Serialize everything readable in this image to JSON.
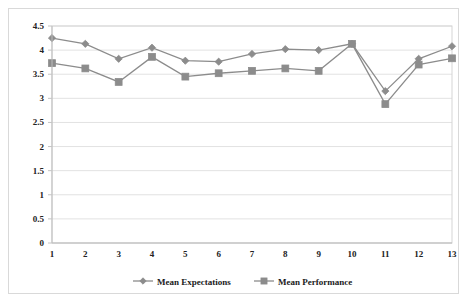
{
  "chart_data": {
    "type": "line",
    "title": "",
    "subtitle": "",
    "xlabel": "",
    "ylabel": "",
    "x": [
      1,
      2,
      3,
      4,
      5,
      6,
      7,
      8,
      9,
      10,
      11,
      12,
      13
    ],
    "categories": [
      "1",
      "2",
      "3",
      "4",
      "5",
      "6",
      "7",
      "8",
      "9",
      "10",
      "11",
      "12",
      "13"
    ],
    "series": [
      {
        "name": "Mean Expectations",
        "marker": "diamond",
        "color": "#8c8c8c",
        "values": [
          4.25,
          4.13,
          3.82,
          4.05,
          3.78,
          3.76,
          3.92,
          4.02,
          4.0,
          4.13,
          3.15,
          3.82,
          4.08
        ]
      },
      {
        "name": "Mean Performance",
        "marker": "square",
        "color": "#8c8c8c",
        "values": [
          3.73,
          3.62,
          3.34,
          3.86,
          3.45,
          3.52,
          3.57,
          3.62,
          3.57,
          4.13,
          2.88,
          3.7,
          3.83
        ]
      }
    ],
    "ylim": [
      0,
      4.5
    ],
    "yticks": [
      "0",
      "0.5",
      "1",
      "1.5",
      "2",
      "2.5",
      "3",
      "3.5",
      "4",
      "4.5"
    ],
    "ytick_values": [
      0,
      0.5,
      1,
      1.5,
      2,
      2.5,
      3,
      3.5,
      4,
      4.5
    ],
    "xlim": [
      1,
      13
    ],
    "grid": true,
    "grid_axis": "y",
    "legend_position": "bottom"
  },
  "legend": {
    "items": [
      {
        "label": "Mean Expectations",
        "marker": "diamond",
        "color": "#8c8c8c"
      },
      {
        "label": "Mean Performance",
        "marker": "square",
        "color": "#8c8c8c"
      }
    ]
  },
  "colors": {
    "series_gray": "#8c8c8c",
    "gridline": "#e2e2e2",
    "axis": "#bdbdbd",
    "text": "#222222",
    "background": "#ffffff"
  }
}
